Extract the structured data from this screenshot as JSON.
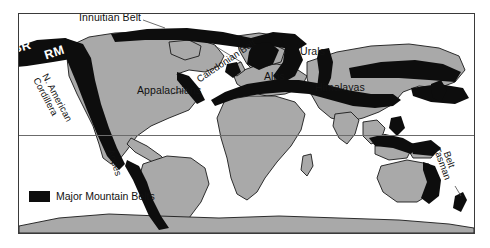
{
  "figure": {
    "type": "world-map",
    "projection": "cylindrical"
  },
  "colors": {
    "belt": "#0d0d0d",
    "land": "#a9a9a9",
    "ocean": "#ffffff",
    "frame": "#3a3a3a",
    "graticule": "#6b6b6b",
    "label": "#111111",
    "label_on_belt": "#ffffff"
  },
  "legend": {
    "swatch_color": "#0d0d0d",
    "label": "Major Mountain Belts"
  },
  "labels": [
    {
      "id": "innuitian-belt",
      "text": "Innuitian Belt",
      "style": "plain",
      "rotation": 0
    },
    {
      "id": "brooks-range",
      "text": "BR",
      "style": "white-on-belt",
      "rotation": -16
    },
    {
      "id": "rocky-mountains",
      "text": "RM",
      "style": "white-on-belt",
      "rotation": -18
    },
    {
      "id": "n-american-cordillera-line1",
      "text": "N. American",
      "style": "plain",
      "rotation": 62
    },
    {
      "id": "n-american-cordillera-line2",
      "text": "Cordillera",
      "style": "plain",
      "rotation": 62
    },
    {
      "id": "appalachians",
      "text": "Appalachians",
      "style": "plain",
      "rotation": 0
    },
    {
      "id": "andes",
      "text": "Andes",
      "style": "plain",
      "rotation": 72
    },
    {
      "id": "caledonian-belt",
      "text": "Caledonian Belt",
      "style": "plain",
      "rotation": -34
    },
    {
      "id": "alps",
      "text": "Alps",
      "style": "plain",
      "rotation": 0
    },
    {
      "id": "urals",
      "text": "Urals",
      "style": "plain",
      "rotation": 0
    },
    {
      "id": "himalayas",
      "text": "Himalayas",
      "style": "plain",
      "rotation": 0
    },
    {
      "id": "tasman-belt-line1",
      "text": "Tasman",
      "style": "plain",
      "rotation": 70
    },
    {
      "id": "tasman-belt-line2",
      "text": "Belt",
      "style": "plain",
      "rotation": 70
    }
  ],
  "label_text": {
    "innuitian_belt": "Innuitian Belt",
    "br": "BR",
    "rm": "RM",
    "cordillera_1": "N. American",
    "cordillera_2": "Cordillera",
    "appalachians": "Appalachians",
    "andes": "Andes",
    "caledonian_belt": "Caledonian Belt",
    "alps": "Alps",
    "urals": "Urals",
    "himalayas": "Himalayas",
    "tasman_1": "Tasman",
    "tasman_2": "Belt"
  },
  "graticules": [
    {
      "id": "equator",
      "y_fraction": 0.555
    }
  ]
}
